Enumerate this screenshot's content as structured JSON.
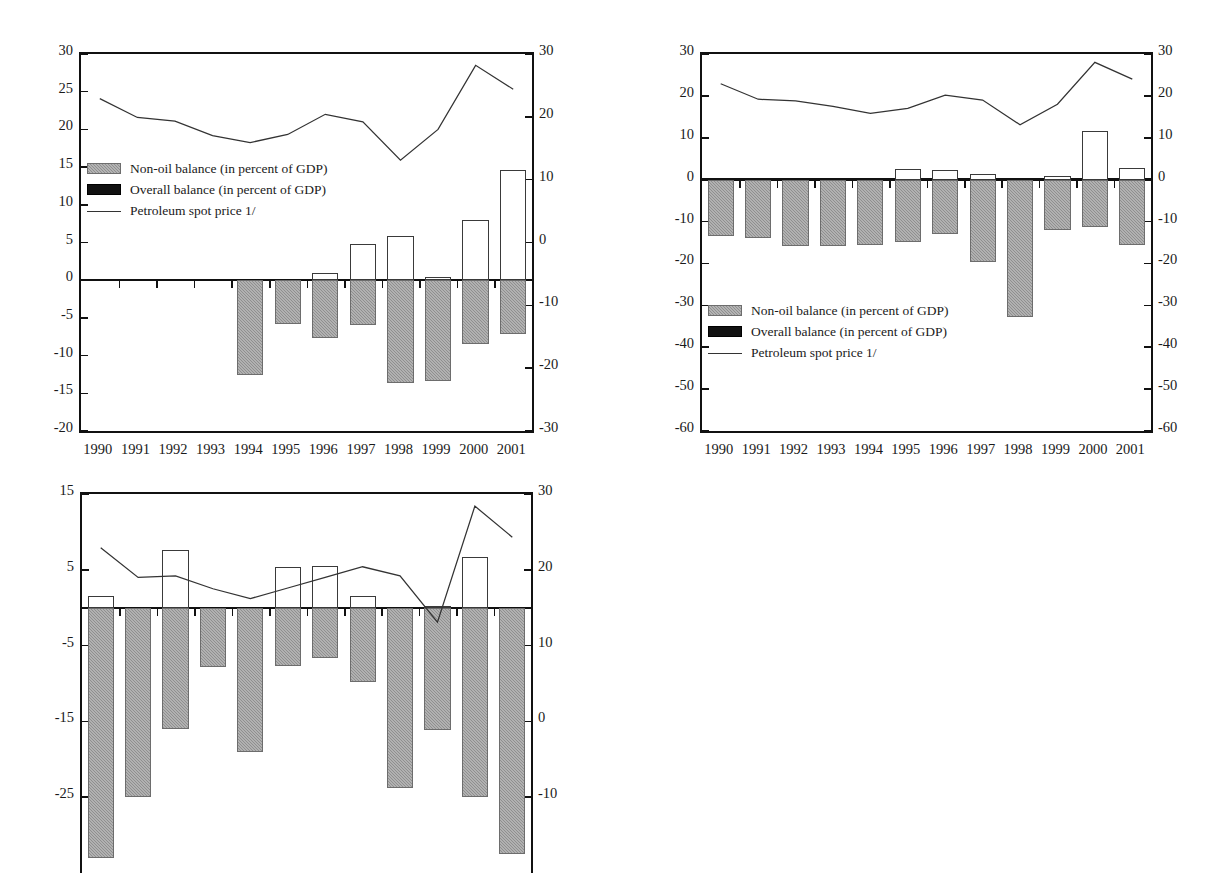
{
  "figure": {
    "footnote_marker": "1/",
    "years": [
      "1990",
      "1991",
      "1992",
      "1993",
      "1994",
      "1995",
      "1996",
      "1997",
      "1998",
      "1999",
      "2000",
      "2001"
    ],
    "legend": {
      "nonoil": "Non-oil balance (in percent of GDP)",
      "overall": "Overall balance (in percent of GDP)",
      "oil": "Petroleum spot price 1/"
    },
    "colors": {
      "nonoil_fill": "#8f8f8f",
      "overall_fill": "#ffffff",
      "overall_legend_fill": "#111111",
      "line": "#333333",
      "axis": "#111111"
    }
  },
  "chart_data": [
    {
      "id": "equatorial-guinea",
      "type": "bar",
      "title": "Equatorial Guinea",
      "xlabel": "",
      "ylabel": "",
      "grid": false,
      "legend_position": "inside-upper-left",
      "categories": [
        "1990",
        "1991",
        "1992",
        "1993",
        "1994",
        "1995",
        "1996",
        "1997",
        "1998",
        "1999",
        "2000",
        "2001"
      ],
      "left_axis": {
        "label": "",
        "ylim": [
          -20,
          30
        ],
        "ticks": [
          30,
          25,
          20,
          15,
          10,
          5,
          0,
          -5,
          -10,
          -15,
          -20
        ]
      },
      "right_axis": {
        "label": "",
        "ylim": [
          -30,
          30
        ],
        "ticks": [
          30,
          20,
          10,
          0,
          -10,
          -20,
          -30
        ]
      },
      "series": [
        {
          "name": "Non-oil balance (in percent of GDP)",
          "axis": "left",
          "kind": "bar",
          "values": [
            0,
            0,
            0,
            0,
            -12.6,
            -5.8,
            -7.7,
            -6.0,
            -13.6,
            -13.4,
            -8.5,
            -7.2
          ]
        },
        {
          "name": "Overall balance (in percent of GDP)",
          "axis": "left",
          "kind": "bar",
          "values": [
            0,
            0,
            0,
            0,
            -10.0,
            -3.1,
            1.0,
            4.8,
            5.9,
            0.4,
            8.0,
            14.6
          ]
        },
        {
          "name": "Petroleum spot price 1/",
          "axis": "right",
          "kind": "line",
          "values": [
            22.9,
            19.9,
            19.3,
            17.0,
            15.9,
            17.2,
            20.4,
            19.2,
            13.1,
            18.0,
            28.2,
            24.4
          ]
        }
      ]
    },
    {
      "id": "gabon",
      "type": "bar",
      "title": "Gabon",
      "xlabel": "",
      "ylabel": "",
      "grid": false,
      "legend_position": "inside-lower-left",
      "categories": [
        "1990",
        "1991",
        "1992",
        "1993",
        "1994",
        "1995",
        "1996",
        "1997",
        "1998",
        "1999",
        "2000",
        "2001"
      ],
      "left_axis": {
        "label": "",
        "ylim": [
          -60,
          30
        ],
        "ticks": [
          30,
          20,
          10,
          0,
          -10,
          -20,
          -30,
          -40,
          -50,
          -60
        ]
      },
      "right_axis": {
        "label": "",
        "ylim": [
          -60,
          30
        ],
        "ticks": [
          30,
          20,
          10,
          0,
          -10,
          -20,
          -30,
          -40,
          -50,
          -60
        ]
      },
      "series": [
        {
          "name": "Non-oil balance (in percent of GDP)",
          "axis": "left",
          "kind": "bar",
          "values": [
            -13.4,
            -14.0,
            -15.8,
            -15.9,
            -15.6,
            -15.0,
            -13.0,
            -19.6,
            -32.9,
            -12.1,
            -11.3,
            -15.7
          ]
        },
        {
          "name": "Overall balance (in percent of GDP)",
          "axis": "left",
          "kind": "bar",
          "values": [
            -4.6,
            -2.4,
            -5.3,
            -5.8,
            -1.8,
            2.5,
            2.2,
            1.4,
            -13.7,
            0.8,
            11.7,
            2.8
          ]
        },
        {
          "name": "Petroleum spot price 1/",
          "axis": "right",
          "kind": "line",
          "values": [
            22.9,
            19.2,
            18.8,
            17.5,
            15.8,
            17.0,
            20.2,
            19.0,
            13.1,
            18.0,
            28.0,
            24.0
          ]
        }
      ]
    },
    {
      "id": "nigeria",
      "type": "bar",
      "title": "Nigeria",
      "xlabel": "",
      "ylabel": "",
      "grid": false,
      "legend_position": "none",
      "categories": [
        "1990",
        "1991",
        "1992",
        "1993",
        "1994",
        "1995",
        "1996",
        "1997",
        "1998",
        "1999",
        "2000",
        "2001"
      ],
      "left_axis": {
        "label": "",
        "ylim": [
          -35,
          15
        ],
        "ticks": [
          15,
          5,
          -5,
          -15,
          -25
        ]
      },
      "right_axis": {
        "label": "",
        "ylim": [
          -20,
          30
        ],
        "ticks": [
          30,
          20,
          10,
          0,
          -10
        ]
      },
      "series": [
        {
          "name": "Non-oil balance (in percent of GDP)",
          "axis": "left",
          "kind": "bar",
          "values": [
            -33.0,
            -25.0,
            -16.0,
            -7.8,
            -19.0,
            -7.7,
            -6.6,
            -9.8,
            -23.8,
            -16.1,
            -25.0,
            -32.5
          ]
        },
        {
          "name": "Overall balance (in percent of GDP)",
          "axis": "left",
          "kind": "bar",
          "values": [
            1.5,
            0.0,
            7.6,
            -7.8,
            -4.2,
            5.4,
            5.5,
            1.5,
            -7.9,
            0.2,
            6.7,
            -3.0
          ]
        },
        {
          "name": "Petroleum spot price 1/",
          "axis": "right",
          "kind": "line",
          "values": [
            22.9,
            19.0,
            19.2,
            17.5,
            16.2,
            17.6,
            19.0,
            20.4,
            19.2,
            13.1,
            28.4,
            24.3
          ]
        }
      ]
    }
  ]
}
